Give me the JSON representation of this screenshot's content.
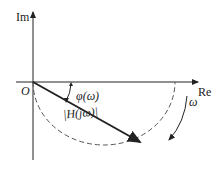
{
  "diagram": {
    "axes": {
      "imaginary_label": "Im",
      "real_label": "Re",
      "origin_label": "O"
    },
    "phase_label": "φ(ω)",
    "magnitude_label": "|H(jω)|",
    "frequency_label": "ω",
    "colors": {
      "stroke": "#222222",
      "dashed": "#555555",
      "background": "#ffffff"
    }
  }
}
